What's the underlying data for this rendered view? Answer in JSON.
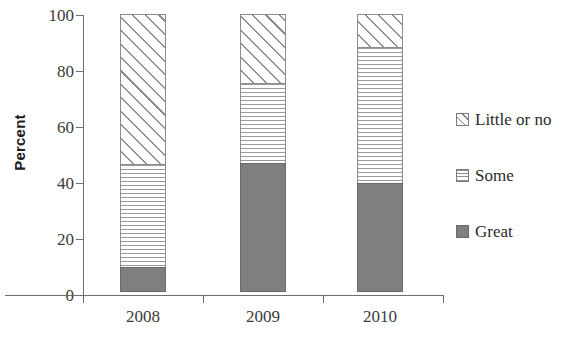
{
  "chart_data": {
    "type": "bar",
    "stacked": true,
    "title": "",
    "subtitle": "",
    "xlabel": "",
    "ylabel": "Percent",
    "ylim": [
      0,
      100
    ],
    "yticks": [
      0,
      20,
      40,
      60,
      80,
      100
    ],
    "ytick_labels": [
      "0",
      "20",
      "40",
      "60",
      "80",
      "100"
    ],
    "grid": false,
    "legend_position": "right",
    "categories": [
      "2008",
      "2009",
      "2010"
    ],
    "series": [
      {
        "name": "Great",
        "values": [
          9,
          46,
          39
        ]
      },
      {
        "name": "Some",
        "values": [
          37,
          29,
          49
        ]
      },
      {
        "name": "Little or no",
        "values": [
          54,
          25,
          12
        ]
      }
    ],
    "colors": {
      "great": "#7f7f7f",
      "some": "#9a9a9a",
      "little_or_no": "#8f8f8f",
      "axis": "#6e6e6e",
      "text": "#2b2b2b",
      "background": "#ffffff"
    },
    "patterns": {
      "great": "solid-dark-gray",
      "some": "horizontal-lines",
      "little_or_no": "diagonal-hatch"
    }
  },
  "axis": {
    "y_title": "Percent",
    "y_ticks": [
      "100",
      "80",
      "60",
      "40",
      "20",
      "0"
    ],
    "x_categories": [
      "2008",
      "2009",
      "2010"
    ]
  },
  "legend": {
    "items": [
      {
        "label": "Little or no",
        "swatch": "diagonal-hatch-swatch"
      },
      {
        "label": "Some",
        "swatch": "horizontal-lines-swatch"
      },
      {
        "label": "Great",
        "swatch": "solid-gray-swatch"
      }
    ]
  }
}
